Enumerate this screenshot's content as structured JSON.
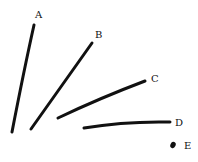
{
  "diagram": {
    "stroke_color": "#111111",
    "background": "#ffffff",
    "lines": [
      {
        "id": "A",
        "label": "A",
        "path": "M34 25 Q24 70 12 132",
        "label_pos": [
          35,
          18
        ]
      },
      {
        "id": "B",
        "label": "B",
        "path": "M92 43 Q62 85 31 129",
        "label_pos": [
          95,
          38
        ]
      },
      {
        "id": "C",
        "label": "C",
        "path": "M145 81 Q100 98 58 118",
        "label_pos": [
          151,
          82
        ]
      },
      {
        "id": "D",
        "label": "D",
        "path": "M84 128 Q125 121 170 122",
        "label_pos": [
          175,
          126
        ]
      }
    ],
    "points": [
      {
        "id": "E",
        "label": "E",
        "center": [
          173,
          145
        ],
        "label_pos": [
          184,
          149
        ]
      }
    ]
  }
}
